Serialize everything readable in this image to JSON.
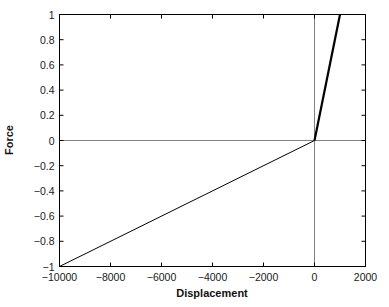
{
  "chart_data": {
    "type": "line",
    "title": "",
    "xlabel": "Displacement",
    "ylabel": "Force",
    "xlim": [
      -10000,
      2000
    ],
    "ylim": [
      -1,
      1
    ],
    "xticks": [
      -10000,
      -8000,
      -6000,
      -4000,
      -2000,
      0,
      2000
    ],
    "xticklabels": [
      "−10000",
      "−8000",
      "−6000",
      "−4000",
      "−2000",
      "0",
      "2000"
    ],
    "yticks": [
      -1,
      -0.8,
      -0.6,
      -0.4,
      -0.2,
      0,
      0.2,
      0.4,
      0.6,
      0.8,
      1
    ],
    "yticklabels": [
      "−1",
      "−0.8",
      "−0.6",
      "−0.4",
      "−0.2",
      "0",
      "0.2",
      "0.4",
      "0.6",
      "0.8",
      "1"
    ],
    "grid": false,
    "legend": null,
    "box": true,
    "tick_direction": "in",
    "reference_lines": [
      {
        "name": "x-zero-line",
        "orientation": "vertical",
        "value": 0,
        "color": "#808080"
      },
      {
        "name": "y-zero-line",
        "orientation": "horizontal",
        "value": 0,
        "color": "#808080"
      }
    ],
    "series": [
      {
        "name": "force-displacement-negative-branch",
        "color": "#000000",
        "linewidth": 1,
        "x": [
          -10000,
          0
        ],
        "y": [
          -1,
          0
        ]
      },
      {
        "name": "force-displacement-positive-branch",
        "color": "#000000",
        "linewidth": 2.2,
        "x": [
          0,
          1000
        ],
        "y": [
          0,
          1
        ]
      }
    ]
  },
  "figure": {
    "background_color": "#ffffff",
    "axes_color": "#000000"
  }
}
